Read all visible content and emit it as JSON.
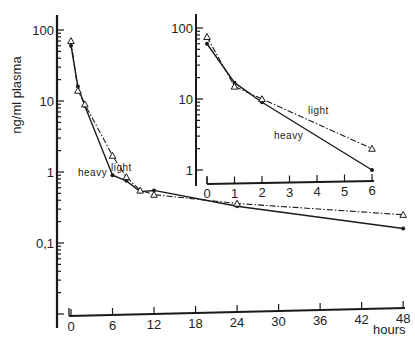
{
  "chart_data": [
    {
      "id": "main",
      "type": "line",
      "title": "",
      "xlabel": "hours",
      "ylabel": "ng/ml plasma",
      "yscale": "log",
      "xlim": [
        0,
        48
      ],
      "ylim": [
        0.03,
        200
      ],
      "grid": false,
      "x_ticks": [
        "0",
        "6",
        "12",
        "18",
        "24",
        "30",
        "36",
        "42",
        "48"
      ],
      "y_ticks": [
        "100",
        "10",
        "1",
        "0,1"
      ],
      "series": [
        {
          "name": "heavy",
          "style": "solid",
          "marker": "dot",
          "x": [
            0,
            1,
            2,
            6,
            8,
            10,
            12,
            24,
            48
          ],
          "values": [
            60,
            16,
            8.5,
            0.9,
            0.75,
            0.53,
            0.55,
            0.33,
            0.16
          ]
        },
        {
          "name": "light",
          "style": "dash-dot",
          "marker": "triangle",
          "x": [
            0,
            1,
            2,
            6,
            8,
            10,
            12,
            24,
            48
          ],
          "values": [
            70,
            14,
            9,
            1.7,
            0.85,
            0.55,
            0.48,
            0.36,
            0.25
          ]
        }
      ],
      "annotations": [
        "light",
        "heavy"
      ]
    },
    {
      "id": "inset",
      "type": "line",
      "title": "",
      "xlabel": "",
      "ylabel": "",
      "yscale": "log",
      "xlim": [
        0,
        6
      ],
      "ylim": [
        0.8,
        150
      ],
      "grid": false,
      "x_ticks": [
        "0",
        "1",
        "2",
        "3",
        "4",
        "5",
        "6"
      ],
      "y_ticks": [
        "100",
        "10",
        "1"
      ],
      "series": [
        {
          "name": "heavy",
          "style": "solid",
          "marker": "dot",
          "x": [
            0,
            1,
            2,
            6
          ],
          "values": [
            60,
            17,
            9,
            1.0
          ]
        },
        {
          "name": "light",
          "style": "dash-dot",
          "marker": "triangle",
          "x": [
            0,
            1,
            2,
            6
          ],
          "values": [
            75,
            15,
            10,
            2.0
          ]
        }
      ],
      "annotations": [
        "light",
        "heavy"
      ]
    }
  ],
  "labels": {
    "ylabel": "ng/ml plasma",
    "xlabel": "hours",
    "light": "light",
    "heavy": "heavy"
  }
}
